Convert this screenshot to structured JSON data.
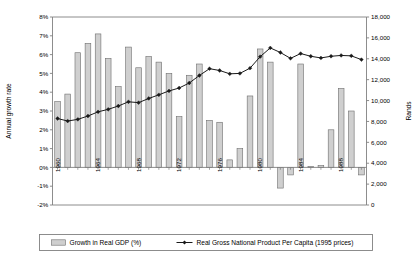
{
  "chart_data": {
    "type": "bar",
    "title": "",
    "subtitle": "",
    "ylabel": "Annual growth rate",
    "ylabel_right": "Rands",
    "xlabel": "",
    "ylim": [
      -0.02,
      0.08
    ],
    "ylim_right": [
      0,
      18000
    ],
    "grid": false,
    "legend_position": "bottom",
    "y_tick_labels": [
      "8%",
      "7%",
      "6%",
      "5%",
      "4%",
      "3%",
      "2%",
      "1%",
      "0%",
      "-1%",
      "-2%"
    ],
    "y_tick_values": [
      0.08,
      0.07,
      0.06,
      0.05,
      0.04,
      0.03,
      0.02,
      0.01,
      0,
      -0.01,
      -0.02
    ],
    "y2_tick_labels": [
      "18,000",
      "16,000",
      "14,000",
      "12,000",
      "10,000",
      "8,000",
      "6,000",
      "4,000",
      "2,000",
      "0"
    ],
    "y2_tick_values": [
      18000,
      16000,
      14000,
      12000,
      10000,
      8000,
      6000,
      4000,
      2000,
      0
    ],
    "x_tick_labels": [
      "1960",
      "1964",
      "1968",
      "1972",
      "1976",
      "1980",
      "1984",
      "1988"
    ],
    "x_tick_years": [
      1960,
      1964,
      1968,
      1972,
      1976,
      1980,
      1984,
      1988
    ],
    "categories": [
      1960,
      1961,
      1962,
      1963,
      1964,
      1965,
      1966,
      1967,
      1968,
      1969,
      1970,
      1971,
      1972,
      1973,
      1974,
      1975,
      1976,
      1977,
      1978,
      1979,
      1980,
      1981,
      1982,
      1983,
      1984,
      1985,
      1986,
      1987,
      1988,
      1989,
      1990
    ],
    "series": [
      {
        "name": "Growth in Real GDP (%)",
        "kind": "bar",
        "axis": "left",
        "values": [
          0.035,
          0.039,
          0.061,
          0.066,
          0.071,
          0.058,
          0.043,
          0.064,
          0.053,
          0.059,
          0.056,
          0.05,
          0.027,
          0.049,
          0.055,
          0.025,
          0.024,
          0.004,
          0.01,
          0.038,
          0.063,
          0.056,
          -0.011,
          -0.004,
          0.055,
          0.0005,
          0.001,
          0.02,
          0.042,
          0.03,
          -0.004
        ]
      },
      {
        "name": "Real Gross National Product Per Capita (1995 prices)",
        "kind": "line",
        "axis": "right",
        "values": [
          8280,
          8040,
          8200,
          8520,
          8920,
          9160,
          9480,
          9880,
          9800,
          10200,
          10550,
          10920,
          11200,
          11680,
          12400,
          13050,
          12880,
          12560,
          12600,
          13100,
          14200,
          15040,
          14600,
          14040,
          14500,
          14240,
          14080,
          14240,
          14320,
          14280,
          13920
        ]
      }
    ],
    "legend": [
      {
        "label": "Growth in Real GDP (%)",
        "marker": "bar-swatch"
      },
      {
        "label": "Real Gross National Product Per Capita (1995 prices)",
        "marker": "line-diamond"
      }
    ],
    "colors": {
      "bar_fill": "#cfcfcf",
      "bar_stroke": "#6e6e6e",
      "line_stroke": "#1a1a1a",
      "marker_fill": "#1a1a1a",
      "axis": "#808080",
      "text": "#000000",
      "plot_background": "#ffffff",
      "legend_border": "#808080"
    }
  }
}
